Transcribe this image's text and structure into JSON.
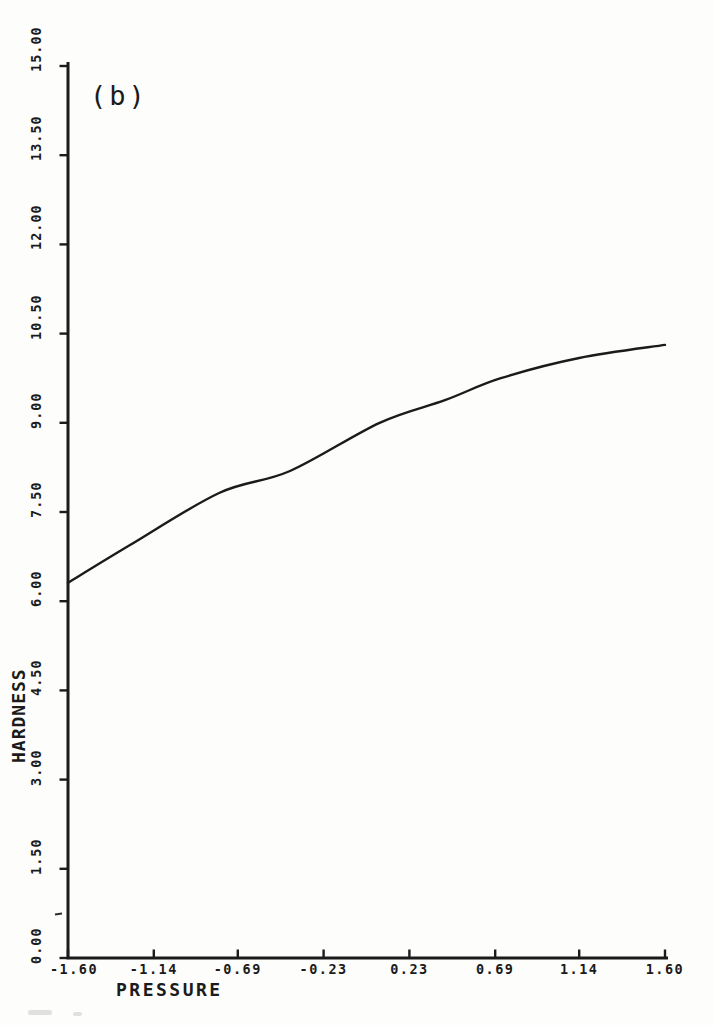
{
  "page": {
    "paper_color": "#fdfdfc",
    "ink_color": "#1b1b1b"
  },
  "chart_data": {
    "type": "line",
    "title": "",
    "panel_label": "(b)",
    "xlabel": "PRESSURE",
    "ylabel": "HARDNESS",
    "xlim": [
      -1.6,
      1.6
    ],
    "ylim": [
      0,
      15
    ],
    "grid": false,
    "legend": null,
    "x_ticks": [
      -1.6,
      -1.14,
      -0.69,
      -0.23,
      0.23,
      0.69,
      1.14,
      1.6
    ],
    "x_tick_labels": [
      "-1.60",
      "-1.14",
      "-0.69",
      "-0.23",
      "0.23",
      "0.69",
      "1.14",
      "1.60"
    ],
    "y_ticks": [
      0,
      1.5,
      3,
      4.5,
      6,
      7.5,
      9,
      10.5,
      12,
      13.5,
      15
    ],
    "y_tick_labels": [
      "0.00",
      "1.50",
      "3.00",
      "4.50",
      "6.00",
      "7.50",
      "9.00",
      "10.50",
      "12.00",
      "13.50",
      "15.00"
    ],
    "series": [
      {
        "name": "hardness response curve",
        "points": [
          [
            -1.6,
            6.31
          ],
          [
            -1.27,
            6.94
          ],
          [
            -0.79,
            7.82
          ],
          [
            -0.41,
            8.19
          ],
          [
            0.07,
            9.0
          ],
          [
            0.42,
            9.38
          ],
          [
            0.72,
            9.75
          ],
          [
            1.14,
            10.09
          ],
          [
            1.6,
            10.31
          ]
        ]
      }
    ]
  }
}
